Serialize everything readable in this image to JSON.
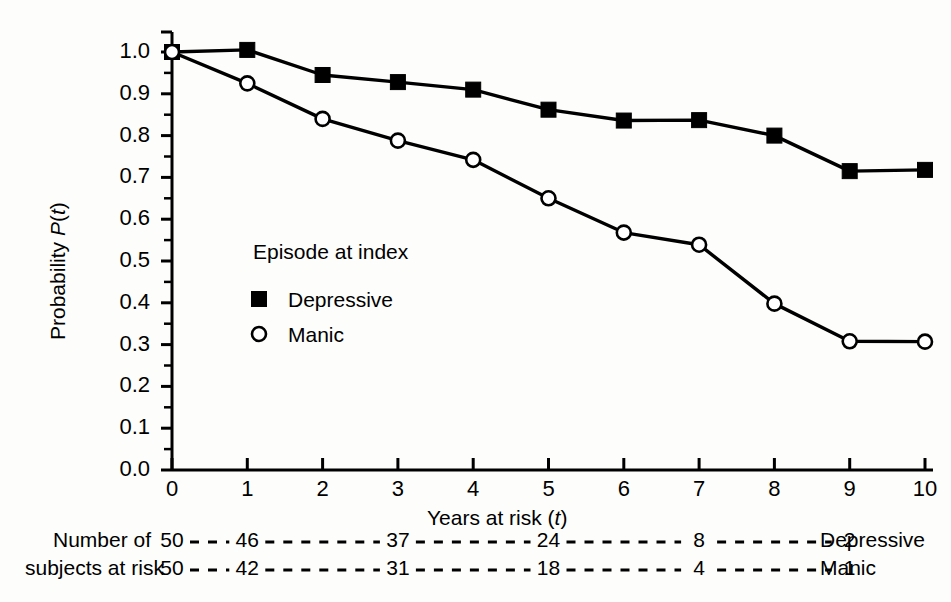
{
  "chart_data": {
    "type": "line",
    "title": "",
    "subtitle": "",
    "xlabel": "Years at risk (t)",
    "ylabel": "Probability P(t)",
    "xlim": [
      0,
      10
    ],
    "ylim": [
      0.0,
      1.0
    ],
    "grid": false,
    "legend_position": "inside-left",
    "legend_title": "Episode at index",
    "x": [
      0,
      1,
      2,
      3,
      4,
      5,
      6,
      7,
      8,
      9,
      10
    ],
    "xticks": [
      "0",
      "1",
      "2",
      "3",
      "4",
      "5",
      "6",
      "7",
      "8",
      "9",
      "10"
    ],
    "yticks": [
      "0.0",
      "0.1",
      "0.2",
      "0.3",
      "0.4",
      "0.5",
      "0.6",
      "0.7",
      "0.8",
      "0.9",
      "1.0"
    ],
    "yminor_step": 0.05,
    "series": [
      {
        "name": "Depressive",
        "marker": "filled-square",
        "color": "#000000",
        "values": [
          1.0,
          1.005,
          0.945,
          0.928,
          0.91,
          0.862,
          0.836,
          0.837,
          0.8,
          0.715,
          0.718
        ]
      },
      {
        "name": "Manic",
        "marker": "open-circle",
        "color": "#000000",
        "values": [
          1.0,
          0.925,
          0.84,
          0.788,
          0.742,
          0.65,
          0.568,
          0.539,
          0.398,
          0.308,
          0.307
        ]
      }
    ],
    "risk_table": {
      "caption_line1": "Number of",
      "caption_line2": "subjects at risk",
      "tick_positions": [
        0,
        1,
        3,
        5,
        7,
        9
      ],
      "rows": [
        {
          "label": "Depressive",
          "values": [
            "50",
            "46",
            "37",
            "24",
            "8",
            "2"
          ]
        },
        {
          "label": "Manic",
          "values": [
            "50",
            "42",
            "31",
            "18",
            "4",
            "1"
          ]
        }
      ]
    }
  },
  "axis": {
    "ylabel_pre": "Probability ",
    "ylabel_italic_p": "P",
    "ylabel_paren_open": "(",
    "ylabel_italic_t": "t",
    "ylabel_paren_close": ")",
    "xlabel_pre": "Years at risk (",
    "xlabel_italic_t": "t",
    "xlabel_post": ")"
  },
  "legend": {
    "title": "Episode at index",
    "items": [
      {
        "label": "Depressive",
        "marker": "filled-square"
      },
      {
        "label": "Manic",
        "marker": "open-circle"
      }
    ]
  }
}
